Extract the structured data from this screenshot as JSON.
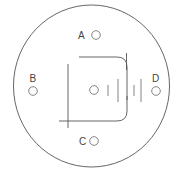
{
  "diagram": {
    "colors": {
      "line": "#555555",
      "text": "#444444",
      "background": "#ffffff"
    },
    "outer_boundary": {
      "shape": "circle"
    },
    "points": [
      {
        "id": "A",
        "label": "A"
      },
      {
        "id": "B",
        "label": "B"
      },
      {
        "id": "C",
        "label": "C"
      },
      {
        "id": "D",
        "label": "D"
      }
    ],
    "center_element": {
      "shape": "small-circle",
      "label": ""
    }
  }
}
